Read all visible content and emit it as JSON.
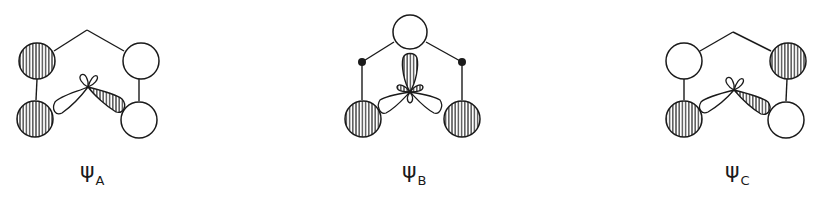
{
  "figure": {
    "panels": [
      {
        "id": "A",
        "symbol": "ψ",
        "subscript": "A",
        "orbitals": [
          {
            "position": "top-left",
            "phase": "shaded"
          },
          {
            "position": "top-right",
            "phase": "open"
          },
          {
            "position": "bottom-left",
            "phase": "shaded"
          },
          {
            "position": "bottom-right",
            "phase": "open"
          }
        ],
        "central_lobes": {
          "left": "open",
          "right": "shaded",
          "small_top": "open"
        }
      },
      {
        "id": "B",
        "symbol": "ψ",
        "subscript": "B",
        "orbitals": [
          {
            "position": "top",
            "phase": "open"
          },
          {
            "position": "bottom-left",
            "phase": "shaded"
          },
          {
            "position": "bottom-right",
            "phase": "shaded"
          }
        ],
        "atoms": [
          "left-dot",
          "right-dot"
        ],
        "central_lobes": {
          "top": "shaded",
          "left": "open",
          "right": "open",
          "bottom": "open",
          "small_sides": "shaded"
        }
      },
      {
        "id": "C",
        "symbol": "ψ",
        "subscript": "C",
        "orbitals": [
          {
            "position": "top-left",
            "phase": "open"
          },
          {
            "position": "top-right",
            "phase": "shaded"
          },
          {
            "position": "bottom-left",
            "phase": "shaded"
          },
          {
            "position": "bottom-right",
            "phase": "open"
          }
        ],
        "central_lobes": {
          "left": "open",
          "right": "shaded",
          "small_top": "open"
        }
      }
    ]
  }
}
